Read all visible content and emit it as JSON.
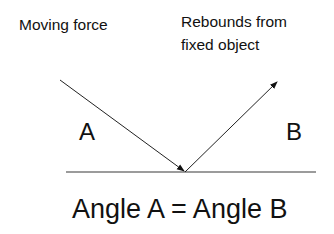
{
  "diagram": {
    "labels": {
      "incoming": "Moving force",
      "outgoing_line1": "Rebounds from",
      "outgoing_line2": "fixed object",
      "angle_a": "A",
      "angle_b": "B",
      "equation": "Angle A = Angle B"
    },
    "elements": {
      "surface": {
        "x1": 66,
        "y1": 172,
        "x2": 316,
        "y2": 172,
        "color": "#777777"
      },
      "incident_ray": {
        "x1": 60,
        "y1": 80,
        "x2": 185,
        "y2": 172,
        "color": "#222222"
      },
      "reflected_ray": {
        "x1": 185,
        "y1": 172,
        "x2": 277,
        "y2": 82,
        "color": "#222222"
      }
    }
  }
}
